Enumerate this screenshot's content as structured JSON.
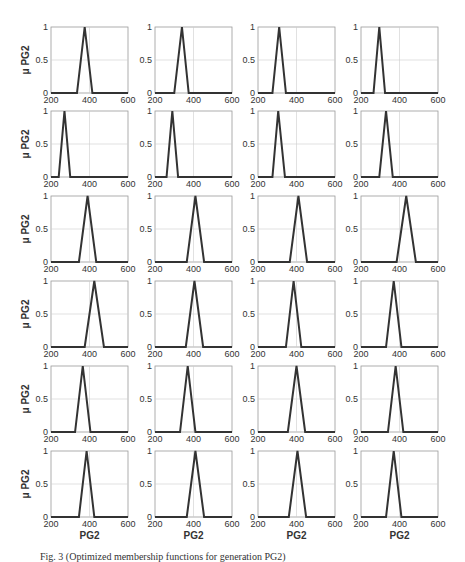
{
  "chart_data": {
    "type": "line",
    "layout": {
      "rows": 6,
      "cols": 4
    },
    "shared": {
      "xlim": [
        200,
        600
      ],
      "ylim": [
        0,
        1
      ],
      "xticks": [
        200,
        400,
        600
      ],
      "yticks": [
        0,
        0.5,
        1
      ],
      "ytick_labels": [
        "0",
        "0.5",
        "1"
      ],
      "xlabel": "PG2",
      "ylabel": "μ PG2",
      "grid": true,
      "line_color": "#333333"
    },
    "panels": [
      {
        "row": 1,
        "col": 1,
        "shape": "triangle",
        "left": 335,
        "peak": 375,
        "right": 415
      },
      {
        "row": 1,
        "col": 2,
        "shape": "triangle",
        "left": 300,
        "peak": 340,
        "right": 375
      },
      {
        "row": 1,
        "col": 3,
        "shape": "triangle",
        "left": 275,
        "peak": 310,
        "right": 345
      },
      {
        "row": 1,
        "col": 4,
        "shape": "triangle",
        "left": 265,
        "peak": 295,
        "right": 325
      },
      {
        "row": 2,
        "col": 1,
        "shape": "triangle",
        "left": 240,
        "peak": 270,
        "right": 300
      },
      {
        "row": 2,
        "col": 2,
        "shape": "triangle",
        "left": 260,
        "peak": 290,
        "right": 320
      },
      {
        "row": 2,
        "col": 3,
        "shape": "triangle",
        "left": 275,
        "peak": 305,
        "right": 340
      },
      {
        "row": 2,
        "col": 4,
        "shape": "triangle",
        "left": 295,
        "peak": 330,
        "right": 365
      },
      {
        "row": 3,
        "col": 1,
        "shape": "triangle",
        "left": 345,
        "peak": 390,
        "right": 435
      },
      {
        "row": 3,
        "col": 2,
        "shape": "triangle",
        "left": 365,
        "peak": 410,
        "right": 455
      },
      {
        "row": 3,
        "col": 3,
        "shape": "triangle",
        "left": 365,
        "peak": 410,
        "right": 455
      },
      {
        "row": 3,
        "col": 4,
        "shape": "triangle",
        "left": 385,
        "peak": 435,
        "right": 485
      },
      {
        "row": 4,
        "col": 1,
        "shape": "triangle",
        "left": 375,
        "peak": 425,
        "right": 475
      },
      {
        "row": 4,
        "col": 2,
        "shape": "triangle",
        "left": 360,
        "peak": 405,
        "right": 450
      },
      {
        "row": 4,
        "col": 3,
        "shape": "triangle",
        "left": 345,
        "peak": 385,
        "right": 425
      },
      {
        "row": 4,
        "col": 4,
        "shape": "triangle",
        "left": 330,
        "peak": 370,
        "right": 410
      },
      {
        "row": 5,
        "col": 1,
        "shape": "triangle",
        "left": 325,
        "peak": 365,
        "right": 405
      },
      {
        "row": 5,
        "col": 2,
        "shape": "triangle",
        "left": 330,
        "peak": 370,
        "right": 410
      },
      {
        "row": 5,
        "col": 3,
        "shape": "triangle",
        "left": 355,
        "peak": 400,
        "right": 445
      },
      {
        "row": 5,
        "col": 4,
        "shape": "triangle",
        "left": 340,
        "peak": 380,
        "right": 420
      },
      {
        "row": 6,
        "col": 1,
        "shape": "triangle",
        "left": 345,
        "peak": 385,
        "right": 425
      },
      {
        "row": 6,
        "col": 2,
        "shape": "triangle",
        "left": 365,
        "peak": 410,
        "right": 455
      },
      {
        "row": 6,
        "col": 3,
        "shape": "triangle",
        "left": 360,
        "peak": 405,
        "right": 450
      },
      {
        "row": 6,
        "col": 4,
        "shape": "triangle",
        "left": 330,
        "peak": 370,
        "right": 410
      }
    ]
  },
  "caption": {
    "text": "Fig. 3 (Optimized membership functions for generation PG2)",
    "note": "caption is clipped at bottom edge; partially legible"
  }
}
